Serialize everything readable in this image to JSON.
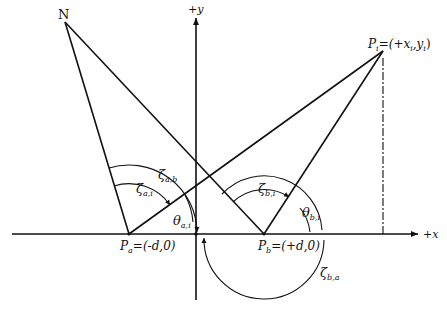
{
  "diagram": {
    "type": "geometry",
    "colors": {
      "stroke": "#111111",
      "background": "#ffffff"
    },
    "points": {
      "N": {
        "label": "N",
        "x": 65,
        "y": 22
      },
      "Pa": {
        "label": "P",
        "sub": "a",
        "coords": "=(-d,0)",
        "x": 129,
        "y": 234
      },
      "Pb": {
        "label": "P",
        "sub": "b",
        "coords": "=(+d,0)",
        "x": 264,
        "y": 234
      },
      "Pi": {
        "label": "P",
        "sub": "i",
        "coords": "=(+x",
        "coords_sub1": "i",
        "coords_mid": ",y",
        "coords_sub2": "i",
        "coords_end": ")",
        "x": 383,
        "y": 51
      }
    },
    "axes": {
      "x_label": "+x",
      "y_label": "+y"
    },
    "angles": {
      "zeta_ab": {
        "symbol": "ζ",
        "sub": "a,b"
      },
      "zeta_ai": {
        "symbol": "ζ",
        "sub": "a,i"
      },
      "theta_ai": {
        "symbol": "θ",
        "sub": "a,i"
      },
      "zeta_bi": {
        "symbol": "ζ",
        "sub": "b,i"
      },
      "theta_bi": {
        "symbol": "θ",
        "sub": "b,i"
      },
      "zeta_ba": {
        "symbol": "ζ",
        "sub": "b,a"
      }
    }
  }
}
